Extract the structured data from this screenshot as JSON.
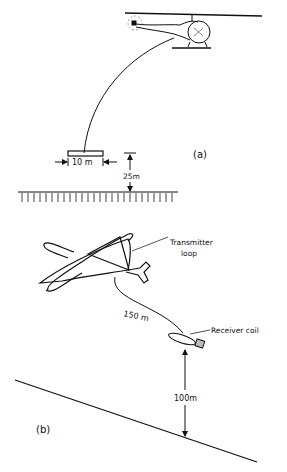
{
  "panel_a": {
    "label": "(a)",
    "loop_width_label": "10 m",
    "loop_height_label": "25m",
    "vehicle": "helicopter"
  },
  "panel_b": {
    "label": "(b)",
    "transmitter_label_line1": "Transmitter",
    "transmitter_label_line2": "loop",
    "cable_length_label": "150 m",
    "receiver_label": "Receiver coil",
    "receiver_height_label": "100m",
    "vehicle": "airplane"
  },
  "colors": {
    "ink": "#111111",
    "background": "#ffffff"
  }
}
